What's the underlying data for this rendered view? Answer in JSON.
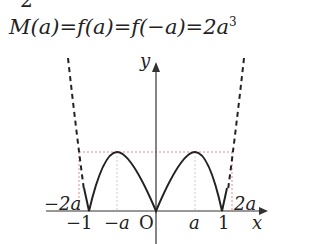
{
  "header_fragment": "2",
  "formula": {
    "lhs": "M(a)",
    "eq1": "=",
    "mid1": "f(a)",
    "eq2": "=",
    "mid2": "f(−a)",
    "eq3": "=",
    "rhs_base": "2a",
    "rhs_exp": "3"
  },
  "axes": {
    "y_label": "y",
    "x_label": "x",
    "origin_label": "O"
  },
  "ticks": {
    "neg_one": "−1",
    "neg_a": "−a",
    "a": "a",
    "one": "1"
  },
  "annotations": {
    "neg_2a": "−2a",
    "pos_2a": "2a"
  },
  "colors": {
    "curve": "#222222",
    "guide": "#e88a8a",
    "axis": "#333333"
  }
}
